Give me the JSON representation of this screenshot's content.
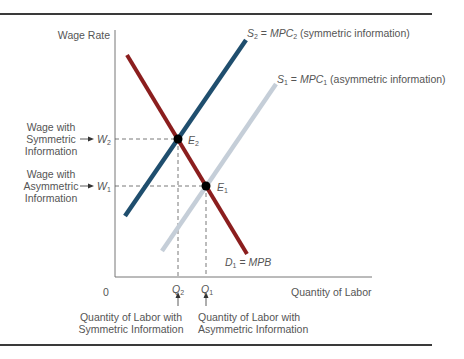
{
  "diagram": {
    "y_axis_label": "Wage Rate",
    "x_axis_label": "Quantity of Labor",
    "origin_label": "0",
    "curves": [
      {
        "id": "S2",
        "label_var": "S",
        "label_sub": "2",
        "label_eq": " = ",
        "label_mpc": "MPC",
        "label_mpc_sub": "2",
        "label_note": " (symmetric information)",
        "color": "#1f4e6e"
      },
      {
        "id": "S1",
        "label_var": "S",
        "label_sub": "1",
        "label_eq": " = ",
        "label_mpc": "MPC",
        "label_mpc_sub": "1",
        "label_note": " (asymmetric information)",
        "color": "#c5ced8"
      },
      {
        "id": "D1",
        "label_var": "D",
        "label_sub": "1",
        "label_eq": " = ",
        "label_mpb": "MPB",
        "color": "#8b1e1e"
      }
    ],
    "equilibria": [
      {
        "id": "E2",
        "var": "E",
        "sub": "2"
      },
      {
        "id": "E1",
        "var": "E",
        "sub": "1"
      }
    ],
    "wages": [
      {
        "id": "W2",
        "var": "W",
        "sub": "2",
        "desc_lines": [
          "Wage with",
          "Symmetric",
          "Information"
        ]
      },
      {
        "id": "W1",
        "var": "W",
        "sub": "1",
        "desc_lines": [
          "Wage with",
          "Asymmetric",
          "Information"
        ]
      }
    ],
    "quantities": [
      {
        "id": "Q2",
        "var": "Q",
        "sub": "2",
        "desc_lines": [
          "Quantity of Labor with",
          "Symmetric Information"
        ]
      },
      {
        "id": "Q1",
        "var": "Q",
        "sub": "1",
        "desc_lines": [
          "Quantity of Labor with",
          "Asymmetric Information"
        ]
      }
    ],
    "arrow_glyph": "→",
    "up_arrow_glyph": "↑"
  }
}
